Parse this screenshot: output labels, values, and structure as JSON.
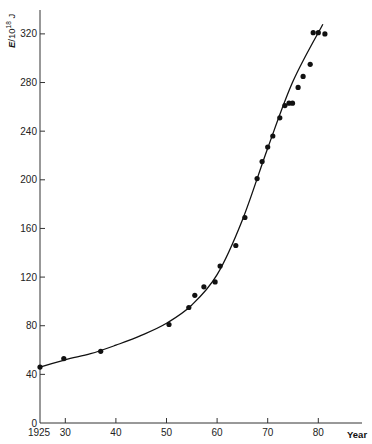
{
  "chart_data": {
    "type": "scatter",
    "title": "",
    "xlabel": "Year",
    "ylabel": "E/10^18 J",
    "ylabel_parts": {
      "var": "E",
      "slash": "/10",
      "exp": "18",
      "unit": " J"
    },
    "xlim": [
      1925,
      1984
    ],
    "ylim": [
      0,
      340
    ],
    "grid": false,
    "legend": null,
    "x_ticks": [
      {
        "value": 1925,
        "label": "1925"
      },
      {
        "value": 1930,
        "label": "30"
      },
      {
        "value": 1940,
        "label": "40"
      },
      {
        "value": 1950,
        "label": "50"
      },
      {
        "value": 1960,
        "label": "60"
      },
      {
        "value": 1970,
        "label": "70"
      },
      {
        "value": 1980,
        "label": "80"
      }
    ],
    "y_ticks": [
      0,
      40,
      80,
      120,
      160,
      200,
      240,
      280,
      320
    ],
    "series": [
      {
        "name": "observed",
        "kind": "scatter",
        "color": "#111111",
        "points": [
          [
            1925.0,
            46
          ],
          [
            1929.7,
            53
          ],
          [
            1937.0,
            59
          ],
          [
            1950.5,
            81
          ],
          [
            1954.4,
            95
          ],
          [
            1955.6,
            105
          ],
          [
            1957.4,
            112
          ],
          [
            1959.6,
            116
          ],
          [
            1960.6,
            129
          ],
          [
            1963.7,
            146
          ],
          [
            1965.5,
            169
          ],
          [
            1967.9,
            201
          ],
          [
            1968.9,
            215
          ],
          [
            1970.0,
            227
          ],
          [
            1971.0,
            236
          ],
          [
            1972.4,
            251
          ],
          [
            1973.4,
            261
          ],
          [
            1974.2,
            263
          ],
          [
            1974.9,
            263
          ],
          [
            1976.0,
            276
          ],
          [
            1977.0,
            285
          ],
          [
            1978.4,
            295
          ],
          [
            1979.0,
            321
          ],
          [
            1980.0,
            321
          ],
          [
            1981.3,
            320
          ]
        ]
      },
      {
        "name": "fitted curve",
        "kind": "line",
        "color": "#111111",
        "points": [
          [
            1925.0,
            46
          ],
          [
            1930.0,
            52
          ],
          [
            1935.0,
            57
          ],
          [
            1940.0,
            64
          ],
          [
            1945.0,
            72
          ],
          [
            1950.0,
            82
          ],
          [
            1955.0,
            97
          ],
          [
            1960.0,
            122
          ],
          [
            1965.0,
            167
          ],
          [
            1970.0,
            226
          ],
          [
            1975.0,
            281
          ],
          [
            1980.9,
            328
          ]
        ]
      }
    ]
  }
}
